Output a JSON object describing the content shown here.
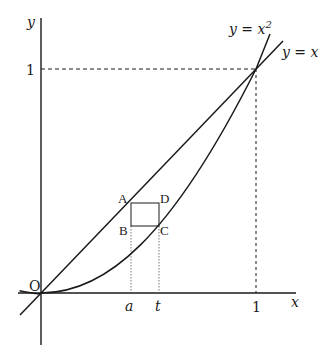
{
  "diagram": {
    "type": "function-graph",
    "axes": {
      "x_label": "x",
      "y_label": "y",
      "origin_label": "O"
    },
    "curves": [
      {
        "name": "line",
        "equation_label": "y = x",
        "expr": "x"
      },
      {
        "name": "parabola",
        "equation_label": "y = x²",
        "expr": "x^2"
      }
    ],
    "ticks": {
      "x": [
        {
          "label": "a",
          "value": 0.42
        },
        {
          "label": "t",
          "value": 0.55
        },
        {
          "label": "1",
          "value": 1
        }
      ],
      "y": [
        {
          "label": "1",
          "value": 1
        }
      ]
    },
    "points": [
      {
        "label": "A",
        "coords": "(a, a)"
      },
      {
        "label": "B",
        "coords": "(a, t²)"
      },
      {
        "label": "C",
        "coords": "(t, t²)"
      },
      {
        "label": "D",
        "coords": "(t, a)"
      }
    ],
    "rectangle": "ABCD",
    "intersection": "(1, 1)"
  },
  "labels": {
    "y_axis": "y",
    "x_axis": "x",
    "origin": "O",
    "one_y": "1",
    "one_x": "1",
    "a": "a",
    "t": "t",
    "A": "A",
    "B": "B",
    "C": "C",
    "D": "D",
    "eq_parabola_lhs": "y = x",
    "eq_parabola_exp": "2",
    "eq_line": "y = x"
  }
}
